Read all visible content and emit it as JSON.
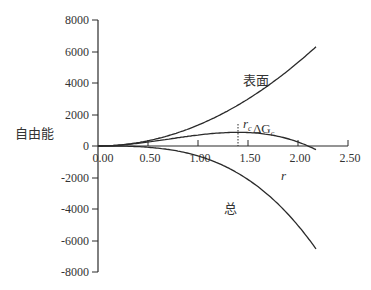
{
  "chart_data": {
    "type": "line",
    "title": "",
    "xlabel": "r",
    "ylabel": "自由能",
    "xlim": [
      0,
      2.5
    ],
    "ylim": [
      -8000,
      8000
    ],
    "x_ticks": [
      "0.00",
      "0.50",
      "1.00",
      "1.50",
      "2.00",
      "2.50"
    ],
    "y_ticks": [
      "8000",
      "6000",
      "4000",
      "2000",
      "0",
      "-2000",
      "-4000",
      "-6000",
      "-8000"
    ],
    "grid": false,
    "legend": "none (inline labels)",
    "x": [
      0,
      0.25,
      0.5,
      0.75,
      1.0,
      1.25,
      1.4,
      1.5,
      1.75,
      2.0,
      2.1,
      2.18
    ],
    "series": [
      {
        "name": "表面",
        "values": [
          0,
          83,
          332,
          746,
          1326,
          2072,
          2599,
          2984,
          4061,
          5304,
          5848,
          6300
        ]
      },
      {
        "name": "总",
        "values": [
          0,
          -10,
          -79,
          -266,
          -631,
          -1232,
          -1732,
          -2130,
          -3382,
          -5048,
          -5844,
          -6540
        ]
      },
      {
        "name": "ΔGc",
        "values": [
          0,
          73,
          253,
          480,
          695,
          840,
          867,
          854,
          679,
          256,
          4,
          -240
        ]
      }
    ],
    "annotations": [
      {
        "text": "表面",
        "near": "upper curve (surface)"
      },
      {
        "text": "总",
        "near": "lower curve (total/volume)"
      },
      {
        "text": "ΔGc",
        "near": "middle curve"
      },
      {
        "text": "rc",
        "x": 1.4,
        "style": "dotted vertical line at critical radius"
      }
    ]
  },
  "labels": {
    "ylabel": "自由能",
    "xlabel": "r",
    "surface": "表面",
    "total": "总",
    "delta_g": "ΔG",
    "delta_g_sub": "c",
    "rc": "r",
    "rc_sub": "c"
  },
  "axes": {
    "x_ticks": [
      "0.00",
      "0.50",
      "1.00",
      "1.50",
      "2.00",
      "2.50"
    ],
    "y_ticks": [
      "8000",
      "6000",
      "4000",
      "2000",
      "0",
      "-2000",
      "-4000",
      "-6000",
      "-8000"
    ]
  },
  "style": {
    "line_color": "#2a2a2a",
    "axis_color": "#2a2a2a"
  }
}
